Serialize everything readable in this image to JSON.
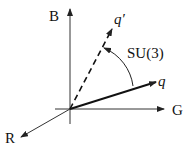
{
  "diagram": {
    "axes": {
      "blue": "B",
      "green": "G",
      "red": "R"
    },
    "vectors": {
      "q": "q",
      "q_prime": "q′"
    },
    "rotation_label": "SU(3)"
  }
}
